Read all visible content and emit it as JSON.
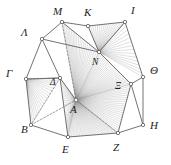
{
  "figure": {
    "background_color": "#ffffff",
    "stroke_color": "#5a5a5a",
    "ray_color": "#9a9a9a",
    "dashed_color": "#6e6e6e",
    "label_color": "#1c1c1c",
    "vertex_fill": "#ffffff",
    "vertex_stroke": "#555555",
    "width": 171,
    "height": 165
  },
  "vertices": [
    {
      "id": "M",
      "label": "M",
      "x": 62,
      "y": 22,
      "lx": 53,
      "ly": 6,
      "type": "outer"
    },
    {
      "id": "K",
      "label": "K",
      "x": 88,
      "y": 26,
      "lx": 84,
      "ly": 7,
      "type": "outer"
    },
    {
      "id": "I",
      "label": "I",
      "x": 125,
      "y": 22,
      "lx": 131,
      "ly": 5,
      "type": "outer"
    },
    {
      "id": "Theta",
      "label": "Θ",
      "x": 143,
      "y": 77,
      "lx": 150,
      "ly": 65,
      "type": "outer"
    },
    {
      "id": "H",
      "label": "H",
      "x": 143,
      "y": 125,
      "lx": 150,
      "ly": 120,
      "type": "outer"
    },
    {
      "id": "Z",
      "label": "Z",
      "x": 118,
      "y": 133,
      "lx": 113,
      "ly": 142,
      "type": "outer"
    },
    {
      "id": "E",
      "label": "E",
      "x": 68,
      "y": 137,
      "lx": 62,
      "ly": 144,
      "type": "outer"
    },
    {
      "id": "B",
      "label": "B",
      "x": 31,
      "y": 125,
      "lx": 21,
      "ly": 124,
      "type": "outer"
    },
    {
      "id": "Gamma",
      "label": "Γ",
      "x": 26,
      "y": 79,
      "lx": 6,
      "ly": 68,
      "type": "outer"
    },
    {
      "id": "Lambda",
      "label": "Λ",
      "x": 42,
      "y": 39,
      "lx": 21,
      "ly": 27,
      "type": "outer"
    },
    {
      "id": "N",
      "label": "N",
      "x": 99,
      "y": 52,
      "lx": 92,
      "ly": 58,
      "type": "inner"
    },
    {
      "id": "Xi",
      "label": "Ξ",
      "x": 131,
      "y": 84,
      "lx": 115,
      "ly": 82,
      "type": "inner"
    },
    {
      "id": "Delta",
      "label": "Δ",
      "x": 60,
      "y": 78,
      "lx": 50,
      "ly": 78,
      "type": "inner"
    },
    {
      "id": "A",
      "label": "A",
      "x": 76,
      "y": 100,
      "lx": 70,
      "ly": 104,
      "type": "center"
    }
  ],
  "outer_polygon": [
    "Lambda",
    "M",
    "K",
    "I",
    "Theta",
    "H",
    "Z",
    "E",
    "B",
    "Gamma"
  ],
  "inner_edges": [
    [
      "Lambda",
      "M"
    ],
    [
      "Lambda",
      "Gamma"
    ],
    [
      "Lambda",
      "N"
    ],
    [
      "Lambda",
      "Delta"
    ],
    [
      "M",
      "K"
    ],
    [
      "M",
      "N"
    ],
    [
      "K",
      "I"
    ],
    [
      "K",
      "N"
    ],
    [
      "I",
      "N"
    ],
    [
      "I",
      "Theta"
    ],
    [
      "N",
      "Xi"
    ],
    [
      "Theta",
      "Xi"
    ],
    [
      "Theta",
      "H"
    ],
    [
      "Xi",
      "H"
    ],
    [
      "Xi",
      "Z"
    ],
    [
      "H",
      "Z"
    ],
    [
      "Z",
      "E"
    ],
    [
      "E",
      "B"
    ],
    [
      "B",
      "Gamma"
    ],
    [
      "Gamma",
      "Delta"
    ],
    [
      "Delta",
      "E"
    ],
    [
      "Delta",
      "A"
    ]
  ],
  "dashed_edges": [
    [
      "M",
      "A"
    ],
    [
      "B",
      "A"
    ],
    [
      "Z",
      "A"
    ],
    [
      "Gamma",
      "Delta"
    ],
    [
      "Delta",
      "B"
    ]
  ],
  "ray_fans": [
    {
      "apex": "A",
      "from": "Delta",
      "to": "E",
      "count": 26,
      "note": "fan sector A-Delta-E"
    },
    {
      "apex": "A",
      "from": "E",
      "to": "Z",
      "count": 30,
      "note": "fan sector A-E-Z"
    },
    {
      "apex": "A",
      "from": "Z",
      "to": "Xi",
      "count": 22,
      "note": "fan sector A-Z-Xi"
    },
    {
      "apex": "A",
      "from": "Xi",
      "to": "N",
      "count": 24,
      "note": "fan sector A-Xi-N"
    },
    {
      "apex": "A",
      "from": "N",
      "to": "M",
      "count": 20,
      "note": "fan sector A-N-M"
    },
    {
      "apex": "N",
      "from": "K",
      "to": "I",
      "count": 16,
      "note": "fan sector N-K-I"
    },
    {
      "apex": "N",
      "from": "I",
      "to": "Theta",
      "count": 14,
      "note": "fan at N toward Theta"
    },
    {
      "apex": "Gamma",
      "from": "B",
      "to": "Delta",
      "count": 18,
      "note": "fan sector Gamma-B-Delta"
    }
  ],
  "counts": {
    "outer_vertices": 10,
    "inner_vertices": 3,
    "center_vertices": 1,
    "total_labels": 14
  }
}
